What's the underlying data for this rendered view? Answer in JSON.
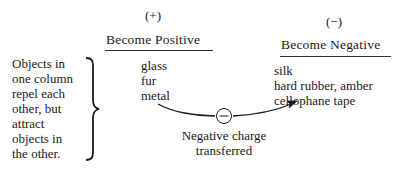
{
  "positive": {
    "sign": "(+)",
    "heading": "Become Positive",
    "items": [
      "glass",
      "fur",
      "metal"
    ]
  },
  "negative": {
    "sign": "(−)",
    "heading": "Become Negative",
    "items": [
      "silk",
      "hard rubber, amber",
      "cellophane tape"
    ]
  },
  "note": {
    "lines": [
      "Objects in",
      "one column",
      "repel each",
      "other, but",
      "attract",
      "objects in",
      "the other."
    ]
  },
  "transfer": {
    "symbol": "−",
    "caption_lines": [
      "Negative charge",
      "transferred"
    ]
  },
  "colors": {
    "ink": "#1a1a1a",
    "background": "#ffffff"
  }
}
